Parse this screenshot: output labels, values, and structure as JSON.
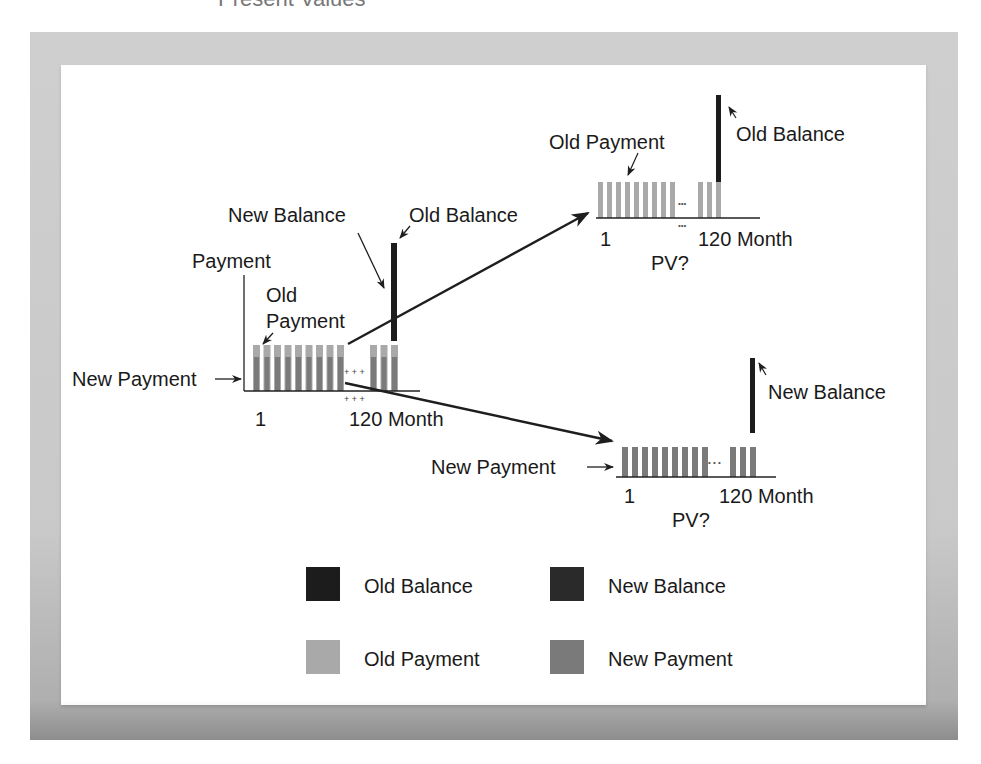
{
  "title": "Present Values",
  "colors": {
    "old_balance": "#1c1c1c",
    "new_balance": "#2a2a2a",
    "old_payment": "#a9a9a9",
    "new_payment": "#7a7a7a",
    "axis": "#222222",
    "arrow": "#1e1e1e"
  },
  "diagrams": {
    "combined": {
      "axis_label": "Payment",
      "old_payment_label_line1": "Old",
      "old_payment_label_line2": "Payment",
      "new_payment_label": "New Payment",
      "new_balance_label": "New Balance",
      "old_balance_label": "Old Balance",
      "start_tick": "1",
      "end_tick": "120 Month",
      "ellipsis": "+ + +"
    },
    "old_loan": {
      "payment_label": "Old Payment",
      "balance_label": "Old Balance",
      "start_tick": "1",
      "end_tick": "120 Month",
      "pv_label": "PV?",
      "ellipsis": "•••"
    },
    "new_loan": {
      "payment_label": "New Payment",
      "balance_label": "New Balance",
      "start_tick": "1",
      "end_tick": "120 Month",
      "pv_label": "PV?",
      "ellipsis": "• • •"
    }
  },
  "legend": {
    "items": [
      {
        "label": "Old Balance",
        "color": "#1c1c1c"
      },
      {
        "label": "New Balance",
        "color": "#2a2a2a"
      },
      {
        "label": "Old Payment",
        "color": "#a9a9a9"
      },
      {
        "label": "New Payment",
        "color": "#7a7a7a"
      }
    ]
  }
}
